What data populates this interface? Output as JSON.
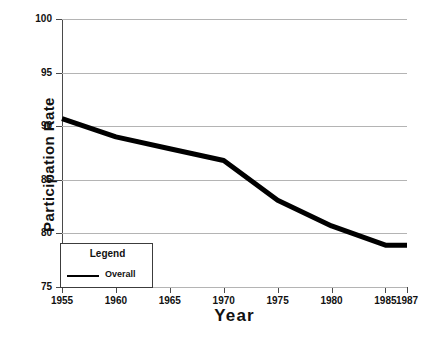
{
  "chart_data": {
    "type": "line",
    "title": "",
    "xlabel": "Year",
    "ylabel": "Participation Rate",
    "xlim": [
      1955,
      1987
    ],
    "ylim": [
      75,
      100
    ],
    "grid": "horizontal",
    "legend_position": "lower-left",
    "legend_title": "Legend",
    "x_tick_labels": [
      "1955",
      "1960",
      "1965",
      "1970",
      "1975",
      "1980",
      "1985",
      "1987"
    ],
    "x_ticks": [
      1955,
      1960,
      1965,
      1970,
      1975,
      1980,
      1985,
      1987
    ],
    "y_tick_labels": [
      "100",
      "95",
      "90",
      "85",
      "80",
      "75"
    ],
    "y_ticks": [
      100,
      95,
      90,
      85,
      80,
      75
    ],
    "series": [
      {
        "name": "Overall",
        "color": "#000000",
        "x": [
          1955,
          1960,
          1965,
          1970,
          1975,
          1980,
          1985,
          1987
        ],
        "values": [
          90.7,
          89.0,
          87.9,
          86.8,
          83.1,
          80.7,
          78.9,
          78.9
        ]
      }
    ]
  },
  "legend": {
    "title": "Legend",
    "entries": [
      {
        "label": "Overall"
      }
    ]
  },
  "axes": {
    "x_title": "Year",
    "y_title": "Participation Rate"
  }
}
